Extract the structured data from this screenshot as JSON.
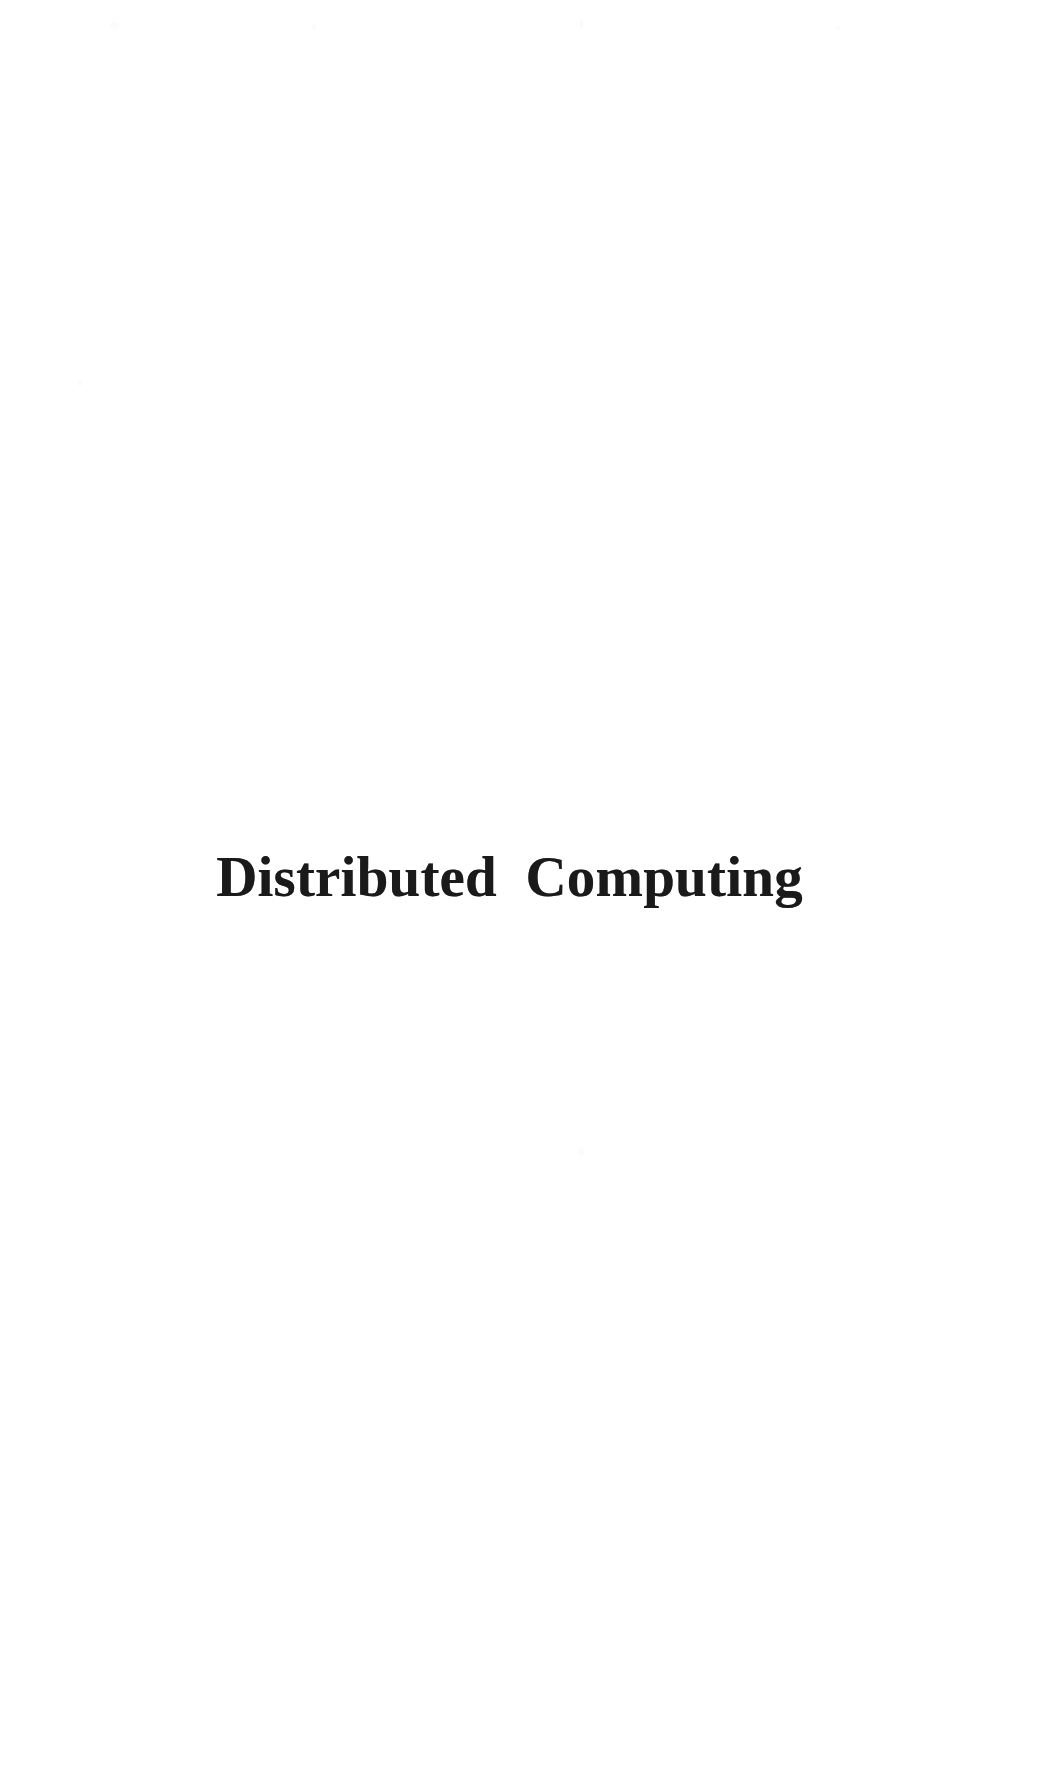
{
  "document": {
    "kind": "scanned-book-half-title-page",
    "page_width": 1064,
    "page_height": 1767,
    "background_color": "#ffffff",
    "ink_color": "#1a1a1a"
  },
  "title": {
    "text": "Distributed Computing",
    "words": [
      "Distributed",
      "Computing"
    ],
    "style": "bold-serif",
    "alignment": "centered"
  },
  "body": {
    "text": ""
  },
  "header": {
    "text": ""
  },
  "footer": {
    "text": ""
  },
  "page_number": {
    "text": ""
  }
}
